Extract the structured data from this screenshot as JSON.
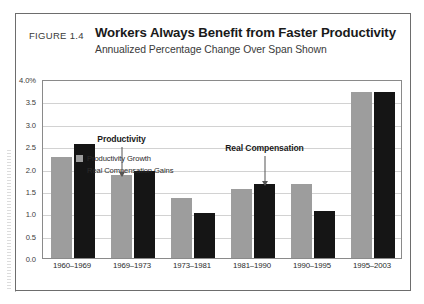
{
  "figure": {
    "number_label": "FIGURE 1.4",
    "title": "Workers Always Benefit from Faster Productivity",
    "subtitle": "Annualized Percentage Change Over Span Shown"
  },
  "legend": {
    "position": "top-left-inside-plot",
    "items": [
      {
        "label": "Productivity Growth",
        "color": "#9d9d9d"
      },
      {
        "label": "Real Compensation Gains",
        "color": "#151515"
      }
    ]
  },
  "annotations": [
    {
      "text": "Productivity",
      "target_category": "1969–1973",
      "target_series": "Productivity Growth"
    },
    {
      "text": "Real Compensation",
      "target_category": "1981–1990",
      "target_series": "Real Compensation Gains"
    }
  ],
  "chart_data": {
    "type": "bar",
    "title": "Workers Always Benefit from Faster Productivity",
    "subtitle": "Annualized Percentage Change Over Span Shown",
    "xlabel": "",
    "ylabel": "",
    "categories": [
      "1960–1969",
      "1969–1973",
      "1973–1981",
      "1981–1990",
      "1990–1995",
      "1995–2003"
    ],
    "series": [
      {
        "name": "Productivity Growth",
        "color": "#9d9d9d",
        "values": [
          2.25,
          1.85,
          1.35,
          1.55,
          1.65,
          3.7
        ]
      },
      {
        "name": "Real Compensation Gains",
        "color": "#151515",
        "values": [
          2.55,
          1.95,
          1.0,
          1.65,
          1.05,
          3.7
        ]
      }
    ],
    "ylim": [
      0.0,
      4.0
    ],
    "ytick_values": [
      4.0,
      3.5,
      3.0,
      2.5,
      2.0,
      1.5,
      1.0,
      0.5,
      0.0
    ],
    "ytick_labels": [
      "4.0%",
      "3.5",
      "3.0",
      "2.5",
      "2.0",
      "1.5",
      "1.0",
      "0.5",
      "0.0"
    ],
    "grid": true,
    "legend_position": "upper left"
  }
}
